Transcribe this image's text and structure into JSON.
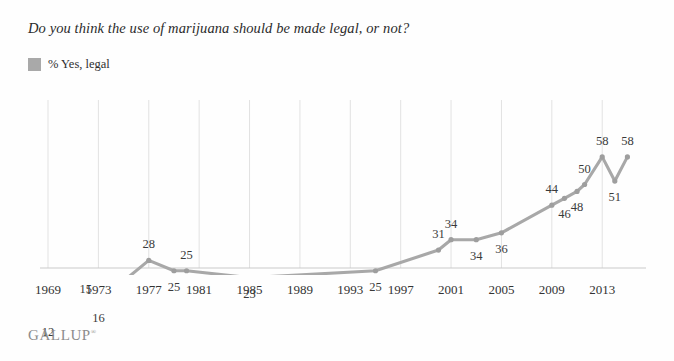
{
  "chart": {
    "title": "Do you think the use of marijuana should be made legal, or not?",
    "legend_label": "% Yes, legal",
    "source_logo": "GALLUP",
    "source_logo_mark": "®",
    "swatch_color": "#a9a9a9",
    "line_color": "#a8a8a8",
    "gridline_color": "#e2e2e2",
    "axis_color": "#c9c9c9"
  },
  "chart_data": {
    "type": "line",
    "title": "Do you think the use of marijuana should be made legal, or not?",
    "xlabel": "",
    "ylabel": "",
    "ylim": [
      0,
      65
    ],
    "xlim": [
      1969,
      2016
    ],
    "grid": "vertical",
    "legend_position": "top-left",
    "series": [
      {
        "name": "% Yes, legal",
        "color": "#a8a8a8",
        "points": [
          {
            "x": 1969,
            "y": 12,
            "label": "12",
            "label_pos": "below"
          },
          {
            "x": 1972,
            "y": 15,
            "label": "15",
            "label_pos": "above"
          },
          {
            "x": 1973,
            "y": 16,
            "label": "16",
            "label_pos": "below"
          },
          {
            "x": 1977,
            "y": 28,
            "label": "28",
            "label_pos": "above"
          },
          {
            "x": 1979,
            "y": 25,
            "label": "25",
            "label_pos": "below"
          },
          {
            "x": 1980,
            "y": 25,
            "label": "25",
            "label_pos": "above"
          },
          {
            "x": 1985,
            "y": 23,
            "label": "23",
            "label_pos": "below"
          },
          {
            "x": 1995,
            "y": 25,
            "label": "25",
            "label_pos": "below"
          },
          {
            "x": 2000,
            "y": 31,
            "label": "31",
            "label_pos": "above"
          },
          {
            "x": 2001,
            "y": 34,
            "label": "34",
            "label_pos": "above"
          },
          {
            "x": 2003,
            "y": 34,
            "label": "34",
            "label_pos": "below"
          },
          {
            "x": 2005,
            "y": 36,
            "label": "36",
            "label_pos": "below"
          },
          {
            "x": 2009,
            "y": 44,
            "label": "44",
            "label_pos": "above"
          },
          {
            "x": 2010,
            "y": 46,
            "label": "46",
            "label_pos": "below"
          },
          {
            "x": 2011,
            "y": 48,
            "label": "48",
            "label_pos": "below"
          },
          {
            "x": 2011.6,
            "y": 50,
            "label": "50",
            "label_pos": "above"
          },
          {
            "x": 2013,
            "y": 58,
            "label": "58",
            "label_pos": "above"
          },
          {
            "x": 2014,
            "y": 51,
            "label": "51",
            "label_pos": "below"
          },
          {
            "x": 2015,
            "y": 58,
            "label": "58",
            "label_pos": "above"
          }
        ]
      }
    ],
    "xticks": [
      "1969",
      "1973",
      "1977",
      "1981",
      "1985",
      "1989",
      "1993",
      "1997",
      "2001",
      "2005",
      "2009",
      "2013"
    ],
    "xtick_values": [
      1969,
      1973,
      1977,
      1981,
      1985,
      1989,
      1993,
      1997,
      2001,
      2005,
      2009,
      2013
    ],
    "yticks": [],
    "ytick_labels": []
  }
}
